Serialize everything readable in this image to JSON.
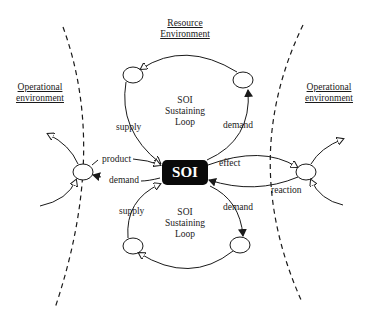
{
  "diagram": {
    "regions": {
      "resource": {
        "line1": "Resource",
        "line2": "Environment"
      },
      "op_left": {
        "line1": "Operational",
        "line2": "environment"
      },
      "op_right": {
        "line1": "Operational",
        "line2": "environment"
      }
    },
    "center_node": "SOI",
    "top_loop": {
      "line1": "SOI",
      "line2": "Sustaining",
      "line3": "Loop"
    },
    "bottom_loop": {
      "line1": "SOI",
      "line2": "Sustaining",
      "line3": "Loop"
    },
    "edge_labels": {
      "top_supply": "supply",
      "top_demand": "demand",
      "product": "product",
      "left_demand": "demand",
      "effect": "effect",
      "reaction": "reaction",
      "bottom_supply": "supply",
      "bottom_demand": "demand"
    },
    "colors": {
      "stroke": "#1a1a1a",
      "soi_fill": "#0a0a0a",
      "soi_text": "#ffffff",
      "background": "#ffffff"
    }
  }
}
